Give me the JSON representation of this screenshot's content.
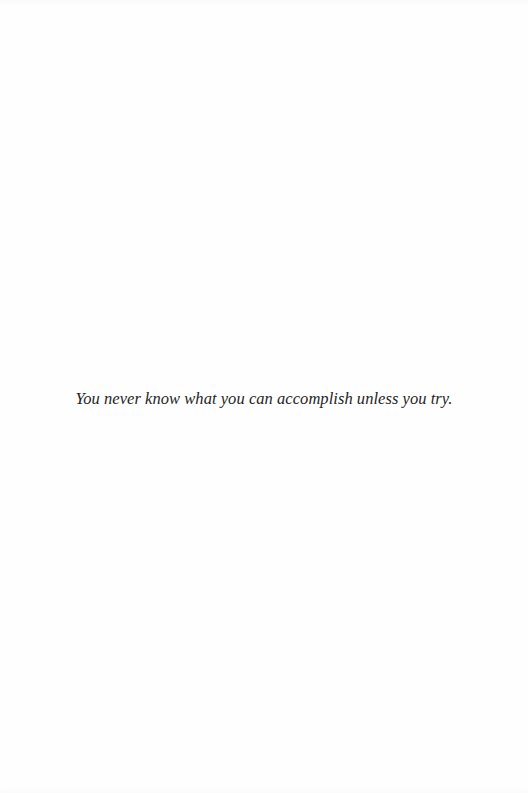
{
  "page": {
    "background_color": "#fefefe",
    "text_color": "#1f1f1f"
  },
  "quote": {
    "text": "You never know what you can accomplish unless you try."
  }
}
